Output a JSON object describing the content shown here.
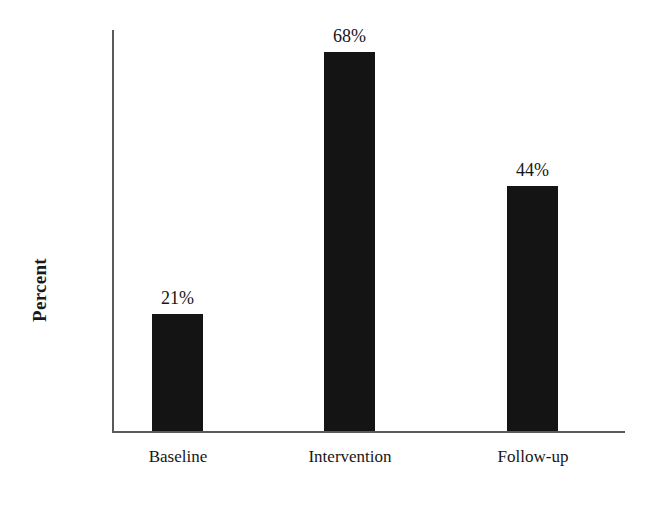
{
  "chart_data": {
    "type": "bar",
    "title": "",
    "xlabel": "",
    "ylabel": "Percent",
    "categories": [
      "Baseline",
      "Intervention",
      "Follow-up"
    ],
    "values": [
      21,
      68,
      44
    ],
    "value_labels": [
      "21%",
      "68%",
      "44%"
    ],
    "ylim": [
      0,
      72
    ],
    "grid": false,
    "legend": false,
    "legend_position": "none",
    "bar_color": "#141414",
    "axis_color": "#5a5a5a",
    "background_color": "#ffffff",
    "value_label_position": "above-bar",
    "units": "percent"
  },
  "axes": {
    "y_title": "Percent",
    "y_title_rotation": "vertical-bottom-to-top",
    "x_axis_visible": true,
    "y_axis_visible": true,
    "tick_labels_y": [],
    "tick_labels_x": [
      "Baseline",
      "Intervention",
      "Follow-up"
    ]
  }
}
